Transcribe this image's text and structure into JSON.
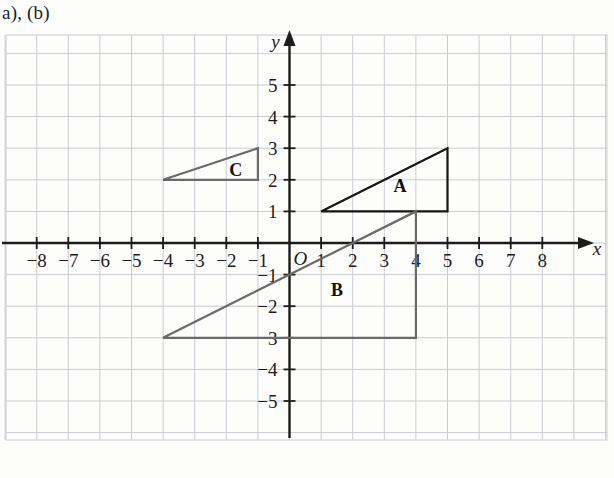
{
  "caption": "a), (b)",
  "chart_data": {
    "type": "scatter",
    "title": "",
    "xlabel": "x",
    "ylabel": "y",
    "xlim": [
      -8.8,
      9.2
    ],
    "ylim": [
      -6.0,
      5.7
    ],
    "grid": true,
    "grid_spacing": 1,
    "legend": "none",
    "axis": {
      "x_name": "x",
      "y_name": "y",
      "origin_label": "O",
      "x_ticks": [
        -8,
        -7,
        -6,
        -5,
        -4,
        -3,
        -2,
        -1,
        1,
        2,
        3,
        4,
        5,
        6,
        7,
        8
      ],
      "x_tick_labels": [
        "-8",
        "-7",
        "-6",
        "-5",
        "-4",
        "-3",
        "-2",
        "-1",
        "1",
        "2",
        "3",
        "4",
        "5",
        "6",
        "7",
        "8"
      ],
      "y_ticks": [
        5,
        4,
        3,
        2,
        1,
        -1,
        -2,
        -3,
        -4,
        -5
      ],
      "y_tick_labels": [
        "5",
        "4",
        "3",
        "2",
        "1",
        "-1",
        "-2",
        "-3",
        "-4",
        "-5"
      ]
    },
    "shapes": [
      {
        "name": "A",
        "label": "A",
        "kind": "triangle",
        "vertices": [
          [
            1,
            1
          ],
          [
            5,
            1
          ],
          [
            5,
            3
          ]
        ],
        "label_position": [
          3.5,
          1.8
        ],
        "stroke": "#151515",
        "stroke_width": 2.2,
        "fill": "none"
      },
      {
        "name": "B",
        "label": "B",
        "kind": "triangle",
        "vertices": [
          [
            -4,
            -3
          ],
          [
            4,
            -3
          ],
          [
            4,
            1
          ]
        ],
        "label_position": [
          1.5,
          -1.5
        ],
        "stroke": "#6a6a6a",
        "stroke_width": 2.2,
        "fill": "none"
      },
      {
        "name": "C",
        "label": "C",
        "kind": "triangle",
        "vertices": [
          [
            -4,
            2
          ],
          [
            -1,
            2
          ],
          [
            -1,
            3
          ]
        ],
        "label_position": [
          -1.7,
          2.3
        ],
        "stroke": "#6a6a6a",
        "stroke_width": 2.2,
        "fill": "none"
      }
    ]
  },
  "colors": {
    "grid_line": "#c9ccd2",
    "axis_line": "#1c1c1c",
    "paper": "#fdfdfc",
    "dark_shape": "#151515",
    "gray_shape": "#6a6a6a"
  }
}
